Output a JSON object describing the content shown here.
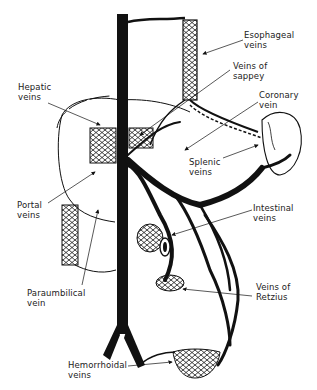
{
  "labels": {
    "esophageal": [
      "Esophageal",
      "veins"
    ],
    "sappey": [
      "Veins of",
      "sappey"
    ],
    "coronary": [
      "Coronary",
      "vein"
    ],
    "hepatic": [
      "Hepatic",
      "veins"
    ],
    "splenic": [
      "Splenic",
      "veins"
    ],
    "portal": [
      "Portal",
      "veins"
    ],
    "intestinal": [
      "Intestinal",
      "veins"
    ],
    "paraumbilical": [
      "Paraumbilical",
      "vein"
    ],
    "retzius": [
      "Veins of",
      "Retzius"
    ],
    "hemorrhoidal": [
      "Hemorrhoidal",
      "veins"
    ]
  },
  "colors": {
    "ink": "#111111",
    "background": "#ffffff",
    "label": "#222222"
  }
}
